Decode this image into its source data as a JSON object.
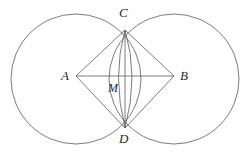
{
  "figure": {
    "kind": "geometry-diagram",
    "background_color": "#ffffff",
    "stroke_color": "#5a5a5a",
    "label_color": "#2b2b2b",
    "stroke_width": 0.8,
    "labels": {
      "A": "A",
      "B": "B",
      "C": "C",
      "D": "D",
      "M": "M"
    },
    "points": {
      "A": {
        "x": 76,
        "y": 76,
        "name": "left-circle-center"
      },
      "B": {
        "x": 174,
        "y": 76,
        "name": "right-circle-center"
      },
      "C": {
        "x": 125,
        "y": 30,
        "name": "upper-intersection"
      },
      "D": {
        "x": 125,
        "y": 128,
        "name": "lower-intersection"
      },
      "M": {
        "x": 125,
        "y": 76,
        "name": "diagonal-midpoint"
      }
    },
    "circles": [
      {
        "id": "left-circle",
        "cx": 76,
        "cy": 79,
        "r": 65
      },
      {
        "id": "right-circle",
        "cx": 174,
        "cy": 79,
        "r": 65
      }
    ],
    "segments": [
      {
        "id": "segment-AB",
        "from": "A",
        "to": "B"
      },
      {
        "id": "segment-CD",
        "from": "C",
        "to": "D"
      },
      {
        "id": "segment-AC",
        "from": "A",
        "to": "C"
      },
      {
        "id": "segment-CB",
        "from": "C",
        "to": "B"
      },
      {
        "id": "segment-BD",
        "from": "B",
        "to": "D"
      },
      {
        "id": "segment-DA",
        "from": "D",
        "to": "A"
      }
    ],
    "lens_arcs": [
      {
        "id": "lens-arc-left",
        "from": "C",
        "to": "D",
        "bulge_x": 113
      },
      {
        "id": "lens-arc-right",
        "from": "C",
        "to": "D",
        "bulge_x": 138
      }
    ]
  }
}
